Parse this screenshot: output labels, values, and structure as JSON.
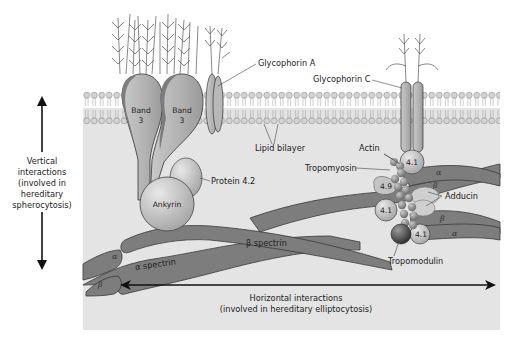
{
  "diagram": {
    "type": "membrane-cytoskeleton-schematic",
    "colors": {
      "cytoplasm": "#e4e4e4",
      "protein_fill": "#b8b8b8",
      "protein_dark": "#7d7d7d",
      "bead": "#9a9a9a",
      "text": "#222222"
    },
    "labels": {
      "glycophorin_a": "Glycophorin A",
      "glycophorin_c": "Glycophorin C",
      "lipid_bilayer": "Lipid bilayer",
      "band3_left_line1": "Band",
      "band3_left_line2": "3",
      "band3_right_line1": "Band",
      "band3_right_line2": "3",
      "protein_42": "Protein 4.2",
      "ankyrin": "Ankyrin",
      "actin": "Actin",
      "tropomyosin": "Tropomyosin",
      "adducin": "Adducin",
      "tropomodulin": "Tropomodulin",
      "protein_41_top": "4.1",
      "protein_41_mid": "4.1",
      "protein_41_bottom": "4.1",
      "protein_49": "4.9",
      "beta_spectrin": "β spectrin",
      "alpha_spectrin": "α spectrin",
      "alpha": "α",
      "beta": "β"
    },
    "vertical_axis": {
      "line1": "Vertical",
      "line2": "interactions",
      "line3": "(involved in",
      "line4": "hereditary",
      "line5": "spherocytosis)"
    },
    "horizontal_axis": {
      "line1": "Horizontal interactions",
      "line2": "(involved in hereditary elliptocytosis)"
    }
  }
}
